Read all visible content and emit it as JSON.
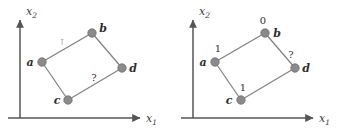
{
  "figure": {
    "panels": [
      {
        "id": "left",
        "axes": {
          "x_label": "x",
          "x_sub": "1",
          "y_label": "x",
          "y_sub": "2"
        },
        "nodes": [
          {
            "id": "a",
            "label": "a",
            "x": 42,
            "y": 62,
            "value": ""
          },
          {
            "id": "b",
            "label": "b",
            "x": 92,
            "y": 33,
            "value": ""
          },
          {
            "id": "c",
            "label": "c",
            "x": 68,
            "y": 100,
            "value": ""
          },
          {
            "id": "d",
            "label": "d",
            "x": 122,
            "y": 68,
            "value": ""
          }
        ],
        "edges": [
          {
            "from": "a",
            "to": "b",
            "label": "⊺"
          },
          {
            "from": "b",
            "to": "d",
            "label": ""
          },
          {
            "from": "a",
            "to": "c",
            "label": ""
          },
          {
            "from": "c",
            "to": "d",
            "label": "?"
          }
        ],
        "edge_marks": [
          {
            "name": "ab-tick",
            "text": "⊺",
            "x": 62,
            "y": 42
          },
          {
            "name": "cd-question",
            "text": "?",
            "x": 94,
            "y": 78
          }
        ]
      },
      {
        "id": "right",
        "axes": {
          "x_label": "x",
          "x_sub": "1",
          "y_label": "x",
          "y_sub": "2"
        },
        "nodes": [
          {
            "id": "a",
            "label": "a",
            "x": 42,
            "y": 62,
            "value": "1"
          },
          {
            "id": "b",
            "label": "b",
            "x": 92,
            "y": 33,
            "value": "0"
          },
          {
            "id": "c",
            "label": "c",
            "x": 68,
            "y": 100,
            "value": "1"
          },
          {
            "id": "d",
            "label": "d",
            "x": 122,
            "y": 68,
            "value": "?"
          }
        ],
        "edges": [
          {
            "from": "a",
            "to": "b",
            "label": ""
          },
          {
            "from": "b",
            "to": "d",
            "label": ""
          },
          {
            "from": "a",
            "to": "c",
            "label": ""
          },
          {
            "from": "c",
            "to": "d",
            "label": ""
          }
        ],
        "edge_marks": []
      }
    ],
    "style": {
      "node_fill": "#8a8a8a",
      "node_stroke": "#6e6e6e",
      "edge_color": "#7f7f7f",
      "axis_color": "#555555",
      "background": "#ffffff",
      "node_radius": 4.2
    }
  }
}
